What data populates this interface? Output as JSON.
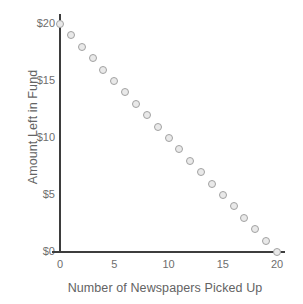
{
  "chart_data": {
    "type": "scatter",
    "title": "",
    "xlabel": "Number of Newspapers Picked Up",
    "ylabel": "Amount Left in Fund",
    "x": [
      0,
      1,
      2,
      3,
      4,
      5,
      6,
      7,
      8,
      9,
      10,
      11,
      12,
      13,
      14,
      15,
      16,
      17,
      18,
      19,
      20
    ],
    "values": [
      20,
      19,
      18,
      17,
      16,
      15,
      14,
      13,
      12,
      11,
      10,
      9,
      8,
      7,
      6,
      5,
      4,
      3,
      2,
      1,
      0
    ],
    "xlim": [
      0,
      20
    ],
    "ylim": [
      0,
      20
    ],
    "xticks": [
      0,
      5,
      10,
      15,
      20
    ],
    "yticks": [
      0,
      5,
      10,
      15,
      20
    ],
    "xtick_labels": [
      "0",
      "5",
      "10",
      "15",
      "20"
    ],
    "ytick_labels": [
      "$0",
      "$5",
      "$10",
      "$15",
      "$20"
    ],
    "grid": false,
    "legend": false,
    "marker_color": "#e9e9e9",
    "marker_edge_color": "#a2a2a2",
    "axis_color": "#3d3d3d",
    "tick_label_color": "#6e6e6e",
    "axis_title_color": "#636363",
    "background_color": "#ffffff"
  }
}
